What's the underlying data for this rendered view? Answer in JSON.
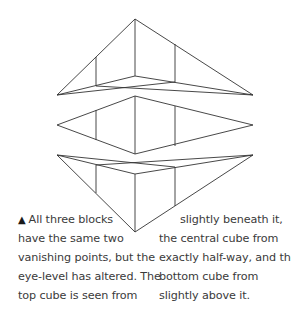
{
  "figure": {
    "line_color": "#333333",
    "cubes": [
      {
        "name": "top-cube",
        "vanishing_points": [
          [
            57,
            95
          ],
          [
            253,
            95
          ]
        ],
        "front_edge": [
          [
            135,
            19
          ],
          [
            135,
            76
          ]
        ],
        "left_edge": [
          [
            96,
            57
          ],
          [
            96,
            86
          ]
        ],
        "right_edge": [
          [
            175,
            44
          ],
          [
            175,
            82
          ]
        ]
      },
      {
        "name": "middle-cube",
        "vanishing_points": [
          [
            57,
            125
          ],
          [
            253,
            125
          ]
        ],
        "front_edge": [
          [
            135,
            96
          ],
          [
            135,
            154
          ]
        ],
        "left_edge": [
          [
            96,
            110
          ],
          [
            96,
            140
          ]
        ],
        "right_edge": [
          [
            175,
            106
          ],
          [
            175,
            146
          ]
        ]
      },
      {
        "name": "bottom-cube",
        "vanishing_points": [
          [
            57,
            155
          ],
          [
            253,
            155
          ]
        ],
        "front_edge": [
          [
            135,
            174
          ],
          [
            135,
            232
          ]
        ],
        "left_edge": [
          [
            96,
            165
          ],
          [
            96,
            193
          ]
        ],
        "right_edge": [
          [
            175,
            167
          ],
          [
            175,
            206
          ]
        ]
      }
    ]
  },
  "caption": {
    "marker": "▲",
    "left_lines": [
      "All three blocks",
      "have the same two",
      "vanishing points, but the",
      "eye-level has altered. The",
      "top cube is seen from"
    ],
    "right_lines": [
      "slightly beneath it,",
      "the central cube from",
      "exactly half-way, and the",
      "bottom cube  from",
      "slightly above it."
    ]
  }
}
